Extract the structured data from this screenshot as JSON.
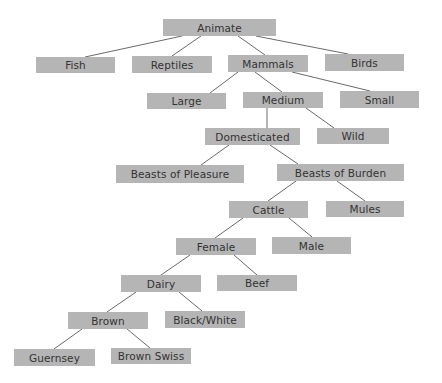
{
  "diagram": {
    "type": "tree",
    "colors": {
      "box_fill": "#b5b5b5",
      "text": "#333333",
      "edge": "#6a6a6a",
      "background": "#ffffff"
    },
    "nodes": [
      {
        "id": "animate",
        "label": "Animate",
        "x": 163,
        "y": 19,
        "w": 113,
        "h": 17
      },
      {
        "id": "fish",
        "label": "Fish",
        "x": 36,
        "y": 57,
        "w": 79,
        "h": 16
      },
      {
        "id": "reptiles",
        "label": "Reptiles",
        "x": 132,
        "y": 56,
        "w": 80,
        "h": 17
      },
      {
        "id": "mammals",
        "label": "Mammals",
        "x": 228,
        "y": 55,
        "w": 80,
        "h": 17
      },
      {
        "id": "birds",
        "label": "Birds",
        "x": 325,
        "y": 54,
        "w": 79,
        "h": 17
      },
      {
        "id": "large",
        "label": "Large",
        "x": 147,
        "y": 93,
        "w": 79,
        "h": 16
      },
      {
        "id": "medium",
        "label": "Medium",
        "x": 243,
        "y": 92,
        "w": 80,
        "h": 16
      },
      {
        "id": "small",
        "label": "Small",
        "x": 340,
        "y": 91,
        "w": 79,
        "h": 17
      },
      {
        "id": "domesticated",
        "label": "Domesticated",
        "x": 205,
        "y": 128,
        "w": 95,
        "h": 17
      },
      {
        "id": "wild",
        "label": "Wild",
        "x": 317,
        "y": 128,
        "w": 72,
        "h": 16
      },
      {
        "id": "beasts_pleasure",
        "label": "Beasts of Pleasure",
        "x": 116,
        "y": 165,
        "w": 128,
        "h": 18
      },
      {
        "id": "beasts_burden",
        "label": "Beasts of Burden",
        "x": 277,
        "y": 164,
        "w": 127,
        "h": 17
      },
      {
        "id": "cattle",
        "label": "Cattle",
        "x": 229,
        "y": 201,
        "w": 79,
        "h": 17
      },
      {
        "id": "mules",
        "label": "Mules",
        "x": 326,
        "y": 201,
        "w": 78,
        "h": 16
      },
      {
        "id": "female",
        "label": "Female",
        "x": 176,
        "y": 238,
        "w": 80,
        "h": 17
      },
      {
        "id": "male",
        "label": "Male",
        "x": 272,
        "y": 237,
        "w": 79,
        "h": 17
      },
      {
        "id": "dairy",
        "label": "Dairy",
        "x": 121,
        "y": 275,
        "w": 80,
        "h": 17
      },
      {
        "id": "beef",
        "label": "Beef",
        "x": 217,
        "y": 275,
        "w": 80,
        "h": 16
      },
      {
        "id": "brown",
        "label": "Brown",
        "x": 68,
        "y": 312,
        "w": 80,
        "h": 17
      },
      {
        "id": "black_white",
        "label": "Black/White",
        "x": 165,
        "y": 311,
        "w": 80,
        "h": 17
      },
      {
        "id": "guernsey",
        "label": "Guernsey",
        "x": 14,
        "y": 349,
        "w": 81,
        "h": 17
      },
      {
        "id": "brown_swiss",
        "label": "Brown Swiss",
        "x": 111,
        "y": 348,
        "w": 80,
        "h": 16
      }
    ],
    "edges": [
      {
        "from": "animate",
        "to": "fish",
        "x1": 182,
        "y1": 36,
        "x2": 85,
        "y2": 57
      },
      {
        "from": "animate",
        "to": "reptiles",
        "x1": 201,
        "y1": 36,
        "x2": 172,
        "y2": 56
      },
      {
        "from": "animate",
        "to": "mammals",
        "x1": 238,
        "y1": 36,
        "x2": 265,
        "y2": 55
      },
      {
        "from": "animate",
        "to": "birds",
        "x1": 256,
        "y1": 36,
        "x2": 348,
        "y2": 54
      },
      {
        "from": "mammals",
        "to": "large",
        "x1": 238,
        "y1": 72,
        "x2": 210,
        "y2": 93
      },
      {
        "from": "mammals",
        "to": "medium",
        "x1": 255,
        "y1": 72,
        "x2": 282,
        "y2": 92
      },
      {
        "from": "mammals",
        "to": "small",
        "x1": 292,
        "y1": 72,
        "x2": 370,
        "y2": 91
      },
      {
        "from": "medium",
        "to": "domesticated",
        "x1": 267,
        "y1": 108,
        "x2": 267,
        "y2": 128
      },
      {
        "from": "medium",
        "to": "wild",
        "x1": 306,
        "y1": 108,
        "x2": 334,
        "y2": 128
      },
      {
        "from": "domesticated",
        "to": "beasts_pleasure",
        "x1": 229,
        "y1": 145,
        "x2": 201,
        "y2": 165
      },
      {
        "from": "domesticated",
        "to": "beasts_burden",
        "x1": 270,
        "y1": 145,
        "x2": 298,
        "y2": 164
      },
      {
        "from": "beasts_burden",
        "to": "cattle",
        "x1": 296,
        "y1": 181,
        "x2": 268,
        "y2": 201
      },
      {
        "from": "beasts_burden",
        "to": "mules",
        "x1": 337,
        "y1": 181,
        "x2": 365,
        "y2": 201
      },
      {
        "from": "cattle",
        "to": "female",
        "x1": 243,
        "y1": 218,
        "x2": 215,
        "y2": 238
      },
      {
        "from": "cattle",
        "to": "male",
        "x1": 289,
        "y1": 218,
        "x2": 312,
        "y2": 237
      },
      {
        "from": "female",
        "to": "dairy",
        "x1": 190,
        "y1": 255,
        "x2": 161,
        "y2": 275
      },
      {
        "from": "female",
        "to": "beef",
        "x1": 234,
        "y1": 255,
        "x2": 257,
        "y2": 275
      },
      {
        "from": "dairy",
        "to": "brown",
        "x1": 136,
        "y1": 292,
        "x2": 107,
        "y2": 312
      },
      {
        "from": "dairy",
        "to": "black_white",
        "x1": 179,
        "y1": 292,
        "x2": 202,
        "y2": 311
      },
      {
        "from": "brown",
        "to": "guernsey",
        "x1": 82,
        "y1": 329,
        "x2": 54,
        "y2": 349
      },
      {
        "from": "brown",
        "to": "brown_swiss",
        "x1": 127,
        "y1": 329,
        "x2": 150,
        "y2": 348
      }
    ]
  }
}
